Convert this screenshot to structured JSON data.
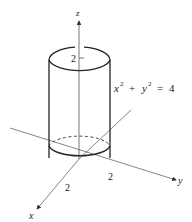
{
  "diagram": {
    "type": "3d-cylinder",
    "equation": {
      "x_part": "x",
      "y_part": "y",
      "sup": "2",
      "plus": "+",
      "equals": "=",
      "rhs": "4"
    },
    "axes": {
      "z_label": "z",
      "y_label": "y",
      "x_label": "x"
    },
    "ticks": {
      "z_tick": "2",
      "x_tick": "2",
      "y_tick": "2"
    },
    "colors": {
      "stroke": "#222222",
      "axis": "#555555",
      "background": "#ffffff"
    }
  }
}
